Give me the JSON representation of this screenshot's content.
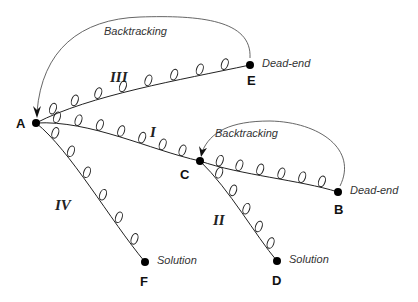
{
  "diagram": {
    "type": "backtracking-search-tree",
    "nodes": [
      {
        "id": "A",
        "label": "A",
        "x": 36,
        "y": 123,
        "annotation": ""
      },
      {
        "id": "B",
        "label": "B",
        "x": 338,
        "y": 192,
        "annotation": "Dead-end"
      },
      {
        "id": "C",
        "label": "C",
        "x": 200,
        "y": 161,
        "annotation": ""
      },
      {
        "id": "D",
        "label": "D",
        "x": 277,
        "y": 261,
        "annotation": "Solution"
      },
      {
        "id": "E",
        "label": "E",
        "x": 250,
        "y": 65,
        "annotation": "Dead-end"
      },
      {
        "id": "F",
        "label": "F",
        "x": 145,
        "y": 262,
        "annotation": "Solution"
      }
    ],
    "paths": [
      {
        "id": "I",
        "label": "I",
        "from": "A",
        "to": "C"
      },
      {
        "id": "II",
        "label": "II",
        "from": "C",
        "to": "D"
      },
      {
        "id": "III",
        "label": "III",
        "from": "A",
        "to": "E"
      },
      {
        "id": "IV",
        "label": "IV",
        "from": "A",
        "to": "F"
      },
      {
        "id": "CB",
        "label": "",
        "from": "C",
        "to": "B"
      }
    ],
    "backtracks": [
      {
        "label": "Backtracking",
        "from": "E",
        "to": "A"
      },
      {
        "label": "Backtracking",
        "from": "B",
        "to": "C"
      }
    ]
  }
}
